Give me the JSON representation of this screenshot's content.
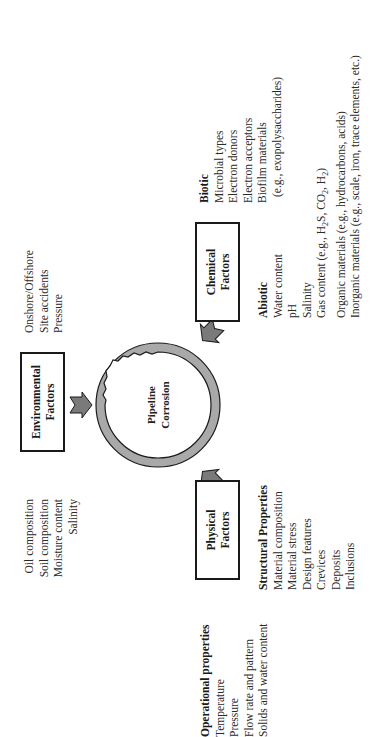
{
  "center": {
    "label_line1": "Pipeline",
    "label_line2": "Corrosion"
  },
  "factors": {
    "environmental": {
      "title_line1": "Environmental",
      "title_line2": "Factors"
    },
    "chemical": {
      "title_line1": "Chemical",
      "title_line2": "Factors"
    },
    "physical": {
      "title_line1": "Physical",
      "title_line2": "Factors"
    }
  },
  "lists": {
    "environmental_left": [
      "Oil composition",
      "Soil composition",
      "Moisture content",
      "Salinity"
    ],
    "environmental_right": [
      "Onshore/Offshore",
      "Site accidents",
      "Pressure"
    ],
    "biotic": {
      "heading": "Biotic",
      "items": [
        "Microbial types",
        "Electron donors",
        "Electron acceptors",
        "Biofilm materials",
        "(e.g., exopolysaccharides)"
      ]
    },
    "abiotic": {
      "heading": "Abiotic",
      "items": [
        "Water content",
        "pH",
        "Salinity",
        "Gas content (e.g., H2S, CO2, H2)",
        "Organic materials (e.g., hydrocarbons, acids)",
        "Inorganic materials (e.g., scale, iron, trace elements, etc.)"
      ]
    },
    "operational": {
      "heading": "Operational properties",
      "items": [
        "Temperature",
        "Pressure",
        "Flow rate and pattern",
        "Solids and water content"
      ]
    },
    "structural": {
      "heading": "Structural Properties",
      "items": [
        "Material composition",
        "Material stress",
        "Design features",
        "Crevices",
        "Deposits",
        "Inclusions"
      ]
    }
  },
  "colors": {
    "pipe_wall": "#a9a9a9",
    "arrow_fill": "#7a7a7a",
    "stroke": "#1a1a1a"
  },
  "orientation": "rotated -90deg"
}
